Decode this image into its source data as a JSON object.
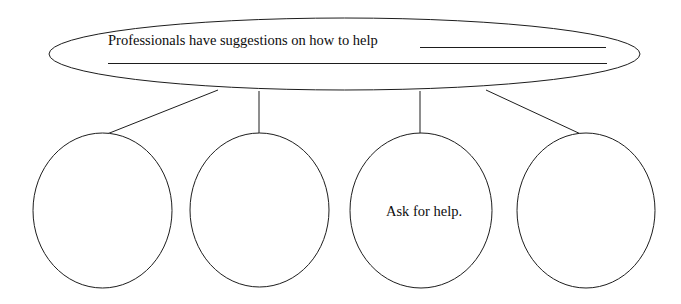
{
  "diagram": {
    "type": "hierarchy-bubble-map",
    "canvas": {
      "width": 681,
      "height": 304,
      "background": "#ffffff"
    },
    "stroke_color": "#1d1d1d",
    "text_color": "#0d0d0d",
    "root": {
      "id": "root-ellipse",
      "prompt_text": "Professionals have suggestions on how to help",
      "blank_line_1": "",
      "blank_line_2": "",
      "shape": "ellipse",
      "cx": 344.5,
      "cy": 54,
      "rx": 295.5,
      "ry": 36
    },
    "children": [
      {
        "id": "child-1",
        "label": "",
        "shape": "ellipse",
        "cx": 102.5,
        "cy": 210.5,
        "rx": 69.5,
        "ry": 77.5,
        "connector": {
          "x1": 218,
          "y1": 90,
          "x2": 102,
          "y2": 136
        }
      },
      {
        "id": "child-2",
        "label": "",
        "shape": "ellipse",
        "cx": 259.5,
        "cy": 210,
        "rx": 69.5,
        "ry": 77,
        "connector": {
          "x1": 259,
          "y1": 91,
          "x2": 259,
          "y2": 139
        }
      },
      {
        "id": "child-3",
        "label": "Ask for help.",
        "shape": "ellipse",
        "cx": 421,
        "cy": 210.5,
        "rx": 71,
        "ry": 77.5,
        "connector": {
          "x1": 420,
          "y1": 91,
          "x2": 420,
          "y2": 139
        }
      },
      {
        "id": "child-4",
        "label": "",
        "shape": "ellipse",
        "cx": 586,
        "cy": 210.5,
        "rx": 69,
        "ry": 77.5,
        "connector": {
          "x1": 486,
          "y1": 90,
          "x2": 585,
          "y2": 136
        }
      }
    ]
  }
}
